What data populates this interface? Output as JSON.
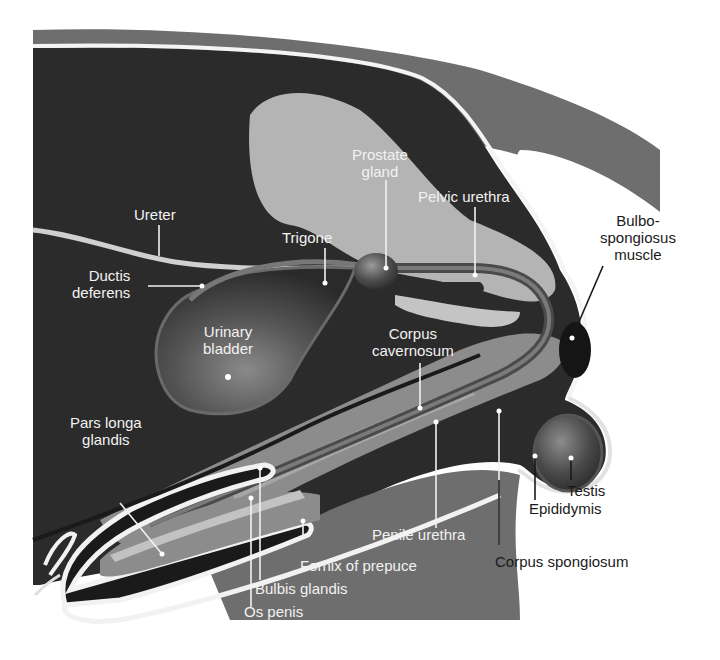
{
  "figure": {
    "colors": {
      "background": "#ffffff",
      "body_dark": "#2b2b2b",
      "skin_gray": "#6e6e6e",
      "bone_light": "#b4b4b4",
      "tissue_mid": "#8c8c8c",
      "outline_white": "#f4f4f4",
      "label_light": "#f2f2f2",
      "label_dark": "#1a1a1a"
    }
  },
  "labels": {
    "prostate_gland": "Prostate\ngland",
    "pelvic_urethra": "Pelvic urethra",
    "ureter": "Ureter",
    "trigone": "Trigone",
    "ductus_deferens": "Ductis\ndeferens",
    "bulbospongiosus": "Bulbo-\nspongiosus\nmuscle",
    "urinary_bladder": "Urinary\nbladder",
    "corpus_cavernosum": "Corpus\ncavernosum",
    "pars_longa_glandis": "Pars longa\nglandis",
    "testis": "Testis",
    "epididymis": "Epididymis",
    "penile_urethra": "Penile urethra",
    "corpus_spongiosum": "Corpus spongiosum",
    "fornix_of_prepuce": "Fornix of prepuce",
    "bulbis_glandis": "Bulbis glandis",
    "os_penis": "Os penis"
  }
}
